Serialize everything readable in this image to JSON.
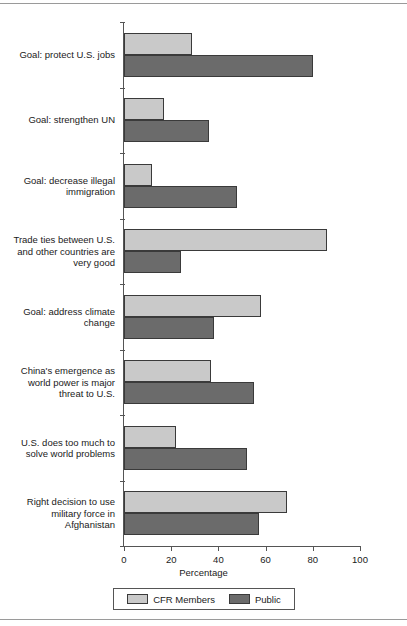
{
  "chart_data": {
    "type": "bar",
    "orientation": "horizontal",
    "title": "",
    "xlabel": "Percentage",
    "ylabel": "",
    "xlim": [
      0,
      100
    ],
    "xticks": [
      "0",
      "20",
      "40",
      "60",
      "80",
      "100"
    ],
    "grid": false,
    "legend_position": "bottom",
    "categories": [
      "Goal: protect U.S. jobs",
      "Goal: strengthen UN",
      "Goal: decrease illegal immigration",
      "Trade ties between U.S. and other countries are very good",
      "Goal: address climate change",
      "China's emergence as world power is major threat to U.S.",
      "U.S. does too much to solve world problems",
      "Right decision to use military force in Afghanistan"
    ],
    "series": [
      {
        "name": "CFR Members",
        "color": "#c9c9c9",
        "values": [
          29,
          17,
          12,
          86,
          58,
          37,
          22,
          69
        ]
      },
      {
        "name": "Public",
        "color": "#6b6b6b",
        "values": [
          80,
          36,
          48,
          24,
          38,
          55,
          52,
          57
        ]
      }
    ]
  },
  "axis": {
    "x_title": "Percentage"
  },
  "legend": {
    "entries": [
      {
        "label": "CFR Members"
      },
      {
        "label": "Public"
      }
    ]
  }
}
